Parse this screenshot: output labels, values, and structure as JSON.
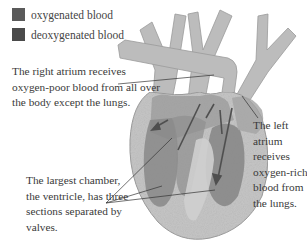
{
  "legend": {
    "items": [
      {
        "label": "oxygenated blood",
        "color": "#5a5a5a"
      },
      {
        "label": "deoxygenated blood",
        "color": "#4a4a4a"
      }
    ]
  },
  "labels": {
    "right_atrium": "The right atrium receives oxygen-poor blood from all over the body except the lungs.",
    "left_atrium": "The left atrium receives oxygen-rich blood from the lungs.",
    "ventricle": "The largest chamber, the ventricle, has three sections separated by valves."
  },
  "colors": {
    "outer_wall": "#c4c4c4",
    "vessel": "#b8b8b8",
    "chamber": "#8a8a8a",
    "arrow": "#505050",
    "leader": "#333333"
  }
}
